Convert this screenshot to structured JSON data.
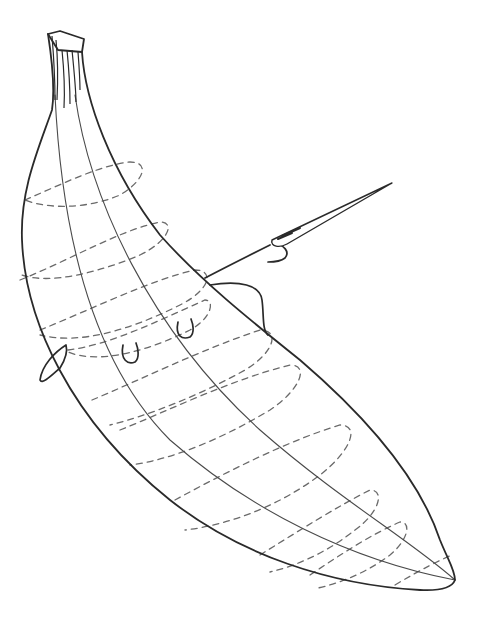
{
  "figure": {
    "background": "#ffffff",
    "stroke_color": "#2a2a2a",
    "dash_color": "#6a6a6a"
  },
  "banana": {
    "outline": "M48 34 C52 60 55 90 52 110 C38 150 20 190 22 240 C25 320 70 420 170 500 C240 555 330 585 420 590 C440 591 452 588 455 580 C455 570 448 560 440 540 C420 480 370 420 300 360 C250 320 200 280 160 235 C110 170 85 100 82 52",
    "stem_top": "M48 34 L60 31 L84 39 L82 52 L58 50 Z",
    "stem_lines": [
      "M52 36 C54 60 55 80 55 100",
      "M56 40 C58 60 58 80 57 100",
      "M62 50 C64 70 65 90 64 108",
      "M67 50 C69 70 70 88 70 104",
      "M72 50 C74 70 76 90 76 102",
      "M78 52 C79 65 80 80 80 90"
    ],
    "ridges": [
      "M55 95 C60 200 80 350 170 440 C250 510 350 560 455 580",
      "M75 95 C90 200 150 330 260 430 C340 500 410 540 455 580"
    ],
    "rings": [
      "M25 200 C60 185 100 165 130 162 C150 162 145 180 120 195 C90 208 50 210 25 200",
      "M20 280 C70 260 120 230 160 222 C175 222 170 240 140 255 C100 272 50 285 22 275",
      "M40 330 C90 310 150 280 195 270 C215 270 210 290 180 305 C130 330 80 345 40 335",
      "M68 350 C110 345 160 320 205 300 C215 300 212 318 190 330 C150 350 100 365 68 352",
      "M92 400 C140 380 200 350 260 330 C280 330 275 352 245 370 C200 395 150 415 110 425",
      "M120 430 C170 410 230 380 290 365 C310 365 300 390 270 410 C220 440 170 460 130 465",
      "M175 500 C230 470 290 440 340 425 C360 425 352 450 320 475 C280 505 230 525 185 530",
      "M260 555 C300 530 340 505 370 490 C385 490 380 512 355 530 C330 550 300 565 270 572",
      "M310 575 C340 555 370 535 400 522 C412 522 408 540 390 555 C370 570 345 582 318 588",
      "M395 585 C420 570 440 560 452 555"
    ]
  },
  "thread": {
    "main": "M205 278 C230 265 250 255 270 245",
    "loop_right": "M210 285 C240 280 260 285 262 300 C264 315 262 330 268 335",
    "loop_left": "M66 345 C55 352 42 365 40 380 C42 385 52 375 60 368 C65 360 68 352 66 345",
    "tail": "M272 242 C285 245 290 252 285 258 C280 262 272 262 268 262"
  },
  "needle": {
    "body": "M272 240 L392 183 L287 244 C280 248 270 247 272 240 Z",
    "eye": "M278 239 L292 233",
    "wrap": "M282 236 L300 228"
  },
  "stitches": [
    "M123 345 C120 360 128 365 135 362 C140 358 138 348 136 343",
    "M178 322 C175 336 182 340 190 337 C195 333 193 324 191 319"
  ]
}
